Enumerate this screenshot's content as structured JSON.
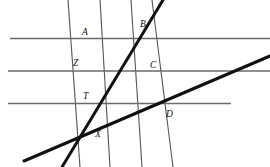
{
  "diagram": {
    "canvas": {
      "width": 270,
      "height": 167,
      "background": "#ffffff"
    },
    "colors": {
      "thin_line": "#555555",
      "horizontal_line": "#6a6a6a",
      "thick_line": "#111111",
      "label_text": "#111111"
    },
    "stroke_widths": {
      "horizontal": 1.6,
      "thin_transversal": 1.1,
      "thick_transversal": 3.0
    },
    "horizontal_lines": [
      {
        "name": "horizontal-line-top",
        "x1": 10,
        "y1": 38.5,
        "x2": 270,
        "y2": 38.5
      },
      {
        "name": "horizontal-line-middle",
        "x1": 8,
        "y1": 71.0,
        "x2": 270,
        "y2": 71.0
      },
      {
        "name": "horizontal-line-bottom",
        "x1": 8,
        "y1": 103.5,
        "x2": 231,
        "y2": 103.5
      }
    ],
    "thin_transversals": [
      {
        "name": "thin-transversal-1",
        "x1": 68,
        "y1": 0,
        "x2": 80,
        "y2": 167
      },
      {
        "name": "thin-transversal-2",
        "x1": 100,
        "y1": 0,
        "x2": 110,
        "y2": 167
      },
      {
        "name": "thin-transversal-3",
        "x1": 131,
        "y1": 0,
        "x2": 142,
        "y2": 167
      },
      {
        "name": "thin-transversal-4",
        "x1": 152,
        "y1": 0,
        "x2": 173,
        "y2": 167
      }
    ],
    "thick_transversals": [
      {
        "name": "thick-line-steep",
        "x1": 62,
        "y1": 167,
        "x2": 163,
        "y2": 0
      },
      {
        "name": "thick-line-shallow",
        "x1": 24,
        "y1": 161,
        "x2": 270,
        "y2": 56
      }
    ],
    "point_labels": [
      {
        "name": "point-label-a",
        "text": "A",
        "x": 82,
        "y": 35
      },
      {
        "name": "point-label-b",
        "text": "B",
        "x": 140,
        "y": 27
      },
      {
        "name": "point-label-z",
        "text": "Z",
        "x": 73,
        "y": 66
      },
      {
        "name": "point-label-c",
        "text": "C",
        "x": 150,
        "y": 68
      },
      {
        "name": "point-label-t",
        "text": "T",
        "x": 83,
        "y": 99
      },
      {
        "name": "point-label-d",
        "text": "D",
        "x": 166,
        "y": 117
      },
      {
        "name": "point-label-x",
        "text": "X",
        "x": 95,
        "y": 137
      }
    ]
  },
  "chart_data": {
    "type": "diagram",
    "labels": [
      "A",
      "B",
      "Z",
      "C",
      "T",
      "D",
      "X"
    ],
    "line_count": {
      "horizontal_parallels": 3,
      "thin_transversals": 4,
      "thick_transversals": 2
    }
  }
}
